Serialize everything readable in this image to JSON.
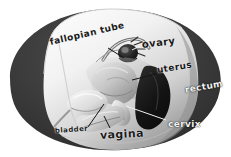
{
  "figure": {
    "background_color": "#ffffff",
    "body_color": "#3a3a3a",
    "cutaway_color": "#f3f3f3",
    "tissue_color": "#b9b9b9",
    "dark_organ_color": "#1c1c1c",
    "leader_dark_color": "#151515",
    "leader_light_color": "#f0f0f0"
  },
  "labels": {
    "fallopian_tube": "fallopian tube",
    "ovary": "ovary",
    "uterus": "uterus",
    "rectum": "rectum",
    "cervix": "cervix",
    "bladder": "bladder",
    "vagina": "vagina"
  },
  "structures": [
    {
      "name": "pelvic-body-outline",
      "label": ""
    },
    {
      "name": "cutaway-face",
      "label": ""
    },
    {
      "name": "fallopian-tube-structure",
      "label": "fallopian tube"
    },
    {
      "name": "ovary-structure",
      "label": "ovary"
    },
    {
      "name": "uterus-structure",
      "label": "uterus"
    },
    {
      "name": "rectum-structure",
      "label": "rectum"
    },
    {
      "name": "cervix-structure",
      "label": "cervix"
    },
    {
      "name": "bladder-structure",
      "label": "bladder"
    },
    {
      "name": "vagina-structure",
      "label": "vagina"
    }
  ]
}
